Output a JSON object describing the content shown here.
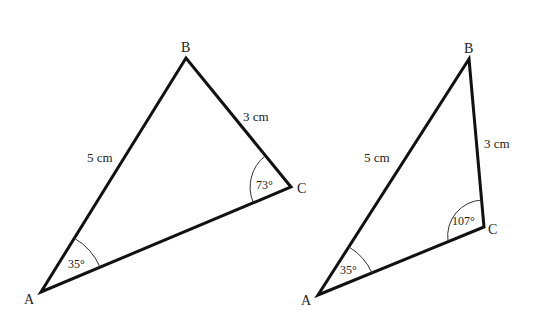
{
  "diagram": {
    "triangles": [
      {
        "id": "triangle-1",
        "vertices": {
          "A": "A",
          "B": "B",
          "C": "C"
        },
        "sides": {
          "AB": "5 cm",
          "BC": "3 cm"
        },
        "angles": {
          "A": "35°",
          "C": "73°"
        }
      },
      {
        "id": "triangle-2",
        "vertices": {
          "A": "A",
          "B": "B",
          "C": "C"
        },
        "sides": {
          "AB": "5 cm",
          "BC": "3 cm"
        },
        "angles": {
          "A": "35°",
          "C": "107°"
        }
      }
    ],
    "colors": {
      "line": "#111111",
      "arc": "#333333",
      "text": "#222222",
      "background": "#ffffff"
    }
  }
}
